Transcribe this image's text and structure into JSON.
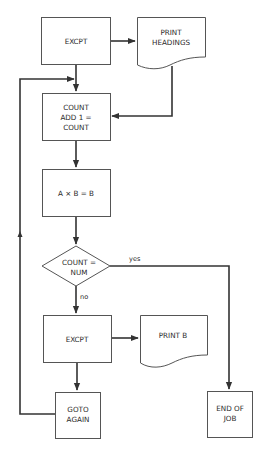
{
  "diagram": {
    "type": "flowchart",
    "nodes": [
      {
        "id": "excpt1",
        "shape": "process",
        "lines": [
          "EXCPT"
        ]
      },
      {
        "id": "print_headings",
        "shape": "document",
        "lines": [
          "PRINT",
          "HEADINGS"
        ]
      },
      {
        "id": "count_add",
        "shape": "process",
        "lines": [
          "COUNT",
          "ADD 1 =",
          "COUNT"
        ]
      },
      {
        "id": "multiply",
        "shape": "process",
        "lines": [
          "A × B = B"
        ]
      },
      {
        "id": "decision",
        "shape": "decision",
        "lines": [
          "COUNT =",
          "NUM"
        ]
      },
      {
        "id": "excpt2",
        "shape": "process",
        "lines": [
          "EXCPT"
        ]
      },
      {
        "id": "print_b",
        "shape": "document",
        "lines": [
          "PRINT B"
        ]
      },
      {
        "id": "goto_again",
        "shape": "process",
        "lines": [
          "GOTO",
          "AGAIN"
        ]
      },
      {
        "id": "end_of_job",
        "shape": "process",
        "lines": [
          "END OF",
          "JOB"
        ]
      }
    ],
    "edges": [
      {
        "from": "excpt1",
        "to": "print_headings",
        "label": ""
      },
      {
        "from": "excpt1",
        "to": "count_add",
        "label": ""
      },
      {
        "from": "print_headings",
        "to": "count_add",
        "label": ""
      },
      {
        "from": "count_add",
        "to": "multiply",
        "label": ""
      },
      {
        "from": "multiply",
        "to": "decision",
        "label": ""
      },
      {
        "from": "decision",
        "to": "end_of_job",
        "label": "yes"
      },
      {
        "from": "decision",
        "to": "excpt2",
        "label": "no"
      },
      {
        "from": "excpt2",
        "to": "print_b",
        "label": ""
      },
      {
        "from": "excpt2",
        "to": "goto_again",
        "label": ""
      },
      {
        "from": "goto_again",
        "to": "count_add",
        "label": ""
      }
    ],
    "labels": {
      "yes": "yes",
      "no": "no"
    }
  }
}
